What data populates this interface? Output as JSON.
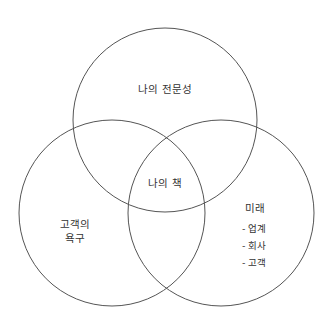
{
  "diagram": {
    "type": "venn",
    "line_color": "#555555",
    "background": "#ffffff",
    "circles": [
      {
        "id": "top",
        "label": "나의 전문성",
        "cx": 165,
        "cy": 120,
        "r": 92
      },
      {
        "id": "left",
        "label_lines": [
          "고객의",
          "욕구"
        ],
        "cx": 112,
        "cy": 213,
        "r": 93
      },
      {
        "id": "right",
        "label": "미래",
        "items": [
          "- 업계",
          "- 회사",
          "- 고객"
        ],
        "cx": 221,
        "cy": 213,
        "r": 93
      }
    ],
    "intersection": {
      "label": "나의 책"
    }
  }
}
